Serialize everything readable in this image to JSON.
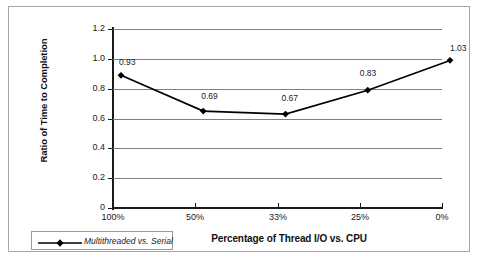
{
  "chart_data": {
    "type": "line",
    "title": "",
    "xlabel": "Percentage of Thread I/O vs. CPU",
    "ylabel": "Ratio of Time to Completion",
    "categories": [
      "100%",
      "50%",
      "33%",
      "25%",
      "0%"
    ],
    "series": [
      {
        "name": "Multithreaded vs. Serial",
        "values": [
          0.93,
          0.69,
          0.67,
          0.83,
          1.03
        ],
        "labels": [
          "0.93",
          "0.69",
          "0.67",
          "0.83",
          "1.03"
        ],
        "color": "#000000",
        "marker": "diamond"
      }
    ],
    "ylim": [
      0,
      1.2
    ],
    "ytick_labels": [
      "0",
      "0.2",
      "0.4",
      "0.6",
      "0.8",
      "1.0",
      "1.2"
    ],
    "ytick_values": [
      0,
      0.2,
      0.4,
      0.6,
      0.8,
      1.0,
      1.2
    ],
    "grid": "horizontal",
    "gridline_color": "#808080",
    "axis_color": "#1a1a1a",
    "legend_position": "bottom-left"
  },
  "legend": {
    "entries": [
      {
        "label": "Multithreaded vs. Serial"
      }
    ]
  },
  "frame": {
    "border_color": "#a6a6a6"
  }
}
